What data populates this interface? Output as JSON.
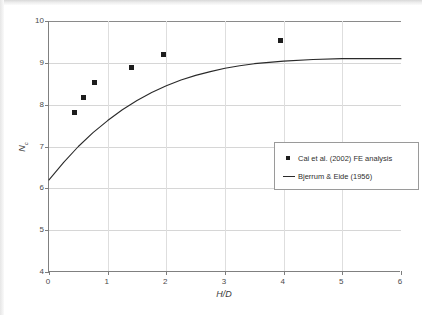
{
  "chart_data": {
    "type": "scatter",
    "title": "",
    "xlabel": "H/D",
    "ylabel": "Nc",
    "ylabel_base": "N",
    "ylabel_sub": "c",
    "xlim": [
      0,
      6
    ],
    "ylim": [
      4,
      10
    ],
    "xticks": [
      0,
      1,
      2,
      3,
      4,
      5,
      6
    ],
    "yticks": [
      4,
      5,
      6,
      7,
      8,
      9,
      10
    ],
    "grid": true,
    "legend_position": "center-right",
    "series": [
      {
        "name": "Cai et al. (2002) FE analysis",
        "type": "scatter",
        "marker": "square",
        "color": "#1d1d1d",
        "points": [
          {
            "x": 0.43,
            "y": 7.82
          },
          {
            "x": 0.58,
            "y": 8.18
          },
          {
            "x": 0.78,
            "y": 8.52
          },
          {
            "x": 1.41,
            "y": 8.9
          },
          {
            "x": 1.96,
            "y": 9.19
          },
          {
            "x": 3.95,
            "y": 9.53
          }
        ]
      },
      {
        "name": "Bjerrum & Eide (1956)",
        "type": "line",
        "color": "#2a2a2a",
        "points": [
          {
            "x": 0.0,
            "y": 6.2
          },
          {
            "x": 0.25,
            "y": 6.62
          },
          {
            "x": 0.5,
            "y": 7.0
          },
          {
            "x": 0.75,
            "y": 7.33
          },
          {
            "x": 1.0,
            "y": 7.62
          },
          {
            "x": 1.25,
            "y": 7.88
          },
          {
            "x": 1.5,
            "y": 8.1
          },
          {
            "x": 1.75,
            "y": 8.29
          },
          {
            "x": 2.0,
            "y": 8.45
          },
          {
            "x": 2.25,
            "y": 8.59
          },
          {
            "x": 2.5,
            "y": 8.7
          },
          {
            "x": 2.75,
            "y": 8.79
          },
          {
            "x": 3.0,
            "y": 8.87
          },
          {
            "x": 3.25,
            "y": 8.93
          },
          {
            "x": 3.5,
            "y": 8.98
          },
          {
            "x": 3.75,
            "y": 9.01
          },
          {
            "x": 4.0,
            "y": 9.04
          },
          {
            "x": 4.5,
            "y": 9.08
          },
          {
            "x": 5.0,
            "y": 9.1
          },
          {
            "x": 5.5,
            "y": 9.1
          },
          {
            "x": 6.0,
            "y": 9.1
          }
        ]
      }
    ]
  },
  "legend": {
    "entries": [
      {
        "label": "Cai et al. (2002) FE analysis",
        "marker": "square"
      },
      {
        "label": "Bjerrum & Eide (1956)",
        "marker": "line"
      }
    ]
  },
  "axes": {
    "y_tick_labels": [
      "10",
      "9",
      "8",
      "7",
      "6",
      "5",
      "4"
    ],
    "x_tick_labels": [
      "0",
      "1",
      "2",
      "3",
      "4",
      "5",
      "6"
    ]
  }
}
